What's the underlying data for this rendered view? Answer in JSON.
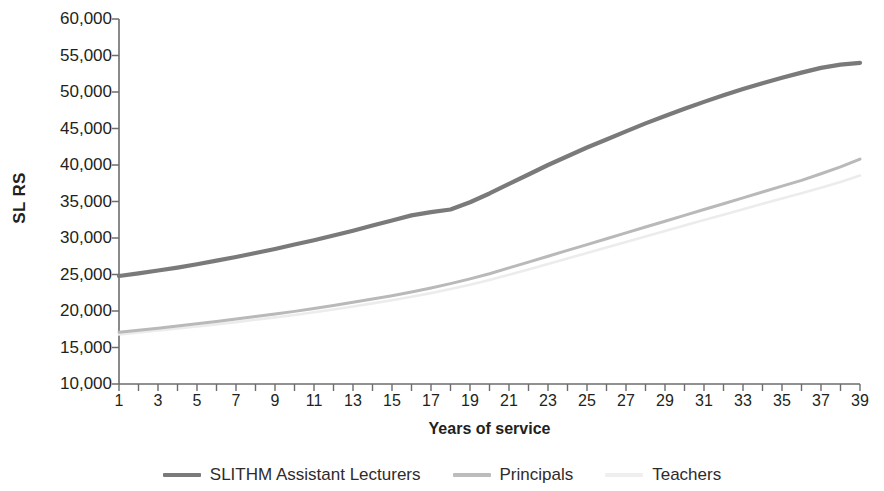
{
  "chart_data": {
    "type": "line",
    "title": "",
    "xlabel": "Years of service",
    "ylabel": "SL RS",
    "xlim": [
      1,
      39
    ],
    "ylim": [
      10000,
      60000
    ],
    "grid": false,
    "legend_position": "bottom",
    "x_tick_step": 1,
    "x_label_step": 2,
    "y_tick_step": 5000,
    "x": [
      1,
      2,
      3,
      4,
      5,
      6,
      7,
      8,
      9,
      10,
      11,
      12,
      13,
      14,
      15,
      16,
      17,
      18,
      19,
      20,
      21,
      22,
      23,
      24,
      25,
      26,
      27,
      28,
      29,
      30,
      31,
      32,
      33,
      34,
      35,
      36,
      37,
      38,
      39
    ],
    "x_tick_labels": [
      "1",
      "",
      "3",
      "",
      "5",
      "",
      "7",
      "",
      "9",
      "",
      "11",
      "",
      "13",
      "",
      "15",
      "",
      "17",
      "",
      "19",
      "",
      "21",
      "",
      "23",
      "",
      "25",
      "",
      "27",
      "",
      "29",
      "",
      "31",
      "",
      "33",
      "",
      "35",
      "",
      "37",
      "",
      "39"
    ],
    "y_tick_labels": [
      "10,000",
      "15,000",
      "20,000",
      "25,000",
      "30,000",
      "35,000",
      "40,000",
      "45,000",
      "50,000",
      "55,000",
      "60,000"
    ],
    "y_tick_values": [
      10000,
      15000,
      20000,
      25000,
      30000,
      35000,
      40000,
      45000,
      50000,
      55000,
      60000
    ],
    "series": [
      {
        "name": "SLITHM Assistant Lecturers",
        "color": "#7a7a7a",
        "width": 4.2,
        "values": [
          24800,
          25150,
          25550,
          25950,
          26400,
          26900,
          27400,
          27950,
          28500,
          29100,
          29700,
          30350,
          31000,
          31700,
          32400,
          33100,
          33550,
          33900,
          34900,
          36100,
          37400,
          38700,
          40000,
          41200,
          42400,
          43500,
          44600,
          45700,
          46700,
          47700,
          48650,
          49550,
          50400,
          51200,
          51950,
          52650,
          53300,
          53750,
          54000
        ]
      },
      {
        "name": "Principals",
        "color": "#b9b9b9",
        "width": 3.0,
        "values": [
          17100,
          17350,
          17650,
          17950,
          18250,
          18550,
          18900,
          19250,
          19600,
          19950,
          20350,
          20750,
          21200,
          21650,
          22100,
          22600,
          23150,
          23750,
          24400,
          25100,
          25900,
          26700,
          27500,
          28300,
          29100,
          29900,
          30700,
          31500,
          32300,
          33100,
          33900,
          34700,
          35500,
          36300,
          37100,
          37900,
          38800,
          39750,
          40800
        ]
      },
      {
        "name": "Teachers",
        "color": "#ececec",
        "width": 2.6,
        "values": [
          16800,
          17050,
          17330,
          17600,
          17880,
          18170,
          18480,
          18800,
          19130,
          19460,
          19830,
          20200,
          20620,
          21040,
          21470,
          21940,
          22450,
          23000,
          23600,
          24250,
          24950,
          25700,
          26450,
          27200,
          27950,
          28700,
          29450,
          30200,
          30950,
          31700,
          32450,
          33200,
          33950,
          34700,
          35420,
          36130,
          36880,
          37680,
          38550
        ]
      }
    ],
    "axis_color": "#6d6d6d"
  },
  "legend": {
    "items": [
      {
        "label": "SLITHM Assistant Lecturers",
        "color": "#7a7a7a"
      },
      {
        "label": "Principals",
        "color": "#bcbcbc"
      },
      {
        "label": "Teachers",
        "color": "#efefef"
      }
    ]
  },
  "axes": {
    "y_title": "SL RS",
    "x_title": "Years of service"
  }
}
